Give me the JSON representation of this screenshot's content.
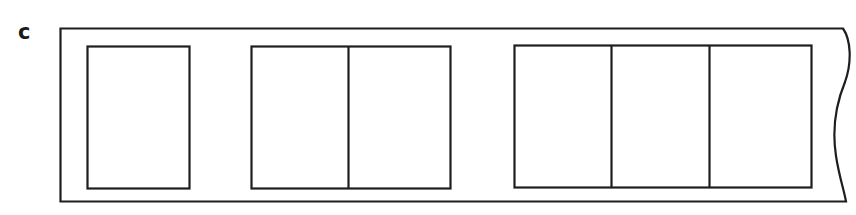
{
  "panel": {
    "label": "c"
  },
  "diagram": {
    "stroke_color": "#1e1e1e",
    "background": "#ffffff",
    "strip": {
      "left": 60,
      "top": 28,
      "bottom": 201,
      "right_edge": "torn-wavy"
    },
    "groups": [
      {
        "name": "group-1",
        "cells": 1,
        "x": 87,
        "y": 46,
        "width": 102,
        "height": 142
      },
      {
        "name": "group-2",
        "cells": 2,
        "x": 251,
        "y": 46,
        "width": 199,
        "height": 142
      },
      {
        "name": "group-3",
        "cells": 3,
        "x": 514,
        "y": 45,
        "width": 297,
        "height": 142
      }
    ]
  }
}
